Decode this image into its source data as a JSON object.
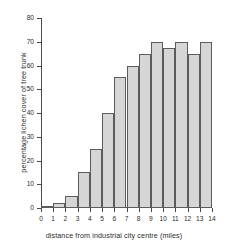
{
  "chart_data": {
    "type": "bar",
    "title": "",
    "xlabel": "distance from industrial city centre (miles)",
    "ylabel": "percentage lichen cover of tree trunk",
    "x_tick_labels": [
      "0",
      "1",
      "2",
      "3",
      "4",
      "5",
      "6",
      "7",
      "8",
      "9",
      "10",
      "11",
      "12",
      "13",
      "14"
    ],
    "y_tick_labels": [
      "0",
      "10",
      "20",
      "30",
      "40",
      "50",
      "60",
      "70",
      "80"
    ],
    "y_ticks": [
      0,
      10,
      20,
      30,
      40,
      50,
      60,
      70,
      80
    ],
    "ylim": [
      0,
      80
    ],
    "xlim": [
      0,
      14
    ],
    "grid": false,
    "legend": null,
    "bin_edges": [
      0,
      1,
      2,
      3,
      4,
      5,
      6,
      7,
      8,
      9,
      10,
      11,
      12,
      13,
      14
    ],
    "categories": [
      "0-1",
      "1-2",
      "2-3",
      "3-4",
      "4-5",
      "5-6",
      "6-7",
      "7-8",
      "8-9",
      "9-10",
      "10-11",
      "11-12",
      "12-13",
      "13-14"
    ],
    "values": [
      1,
      2,
      5,
      15,
      25,
      40,
      55,
      60,
      65,
      70,
      67.5,
      70,
      65,
      70
    ],
    "bar_fill_color": "#d6d6d6",
    "bar_border_color": "#5c5c5c",
    "axis_color": "#4a4a4a",
    "text_color": "#2b2b2b",
    "background_color": "#ffffff"
  }
}
